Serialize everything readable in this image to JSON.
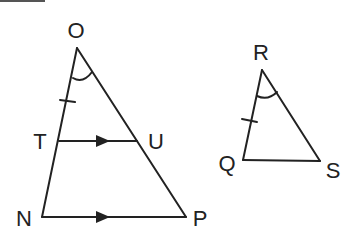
{
  "diagram": {
    "left_triangle": {
      "name": "Triangle ONP",
      "vertices": {
        "O": {
          "label": "O",
          "x": 77,
          "y": 48,
          "lx": 76,
          "ly": 38
        },
        "N": {
          "label": "N",
          "x": 42,
          "y": 217,
          "lx": 24,
          "ly": 226
        },
        "P": {
          "label": "P",
          "x": 186,
          "y": 217,
          "lx": 200,
          "ly": 226
        },
        "T": {
          "label": "T",
          "x": 59,
          "y": 141,
          "lx": 40,
          "ly": 149
        },
        "U": {
          "label": "U",
          "x": 137,
          "y": 141,
          "lx": 156,
          "ly": 149
        }
      },
      "segments": [
        "O-N",
        "O-P",
        "T-U",
        "N-P"
      ],
      "markings": {
        "angle_arc_at": "O",
        "tick_mark_on": "O-T",
        "parallel_arrows_on": [
          "T-U",
          "N-P"
        ]
      }
    },
    "right_triangle": {
      "name": "Triangle RQS",
      "vertices": {
        "R": {
          "label": "R",
          "x": 262,
          "y": 70,
          "lx": 261,
          "ly": 60
        },
        "Q": {
          "label": "Q",
          "x": 243,
          "y": 160,
          "lx": 227,
          "ly": 171
        },
        "S": {
          "label": "S",
          "x": 320,
          "y": 161,
          "lx": 333,
          "ly": 178
        }
      },
      "segments": [
        "R-Q",
        "R-S",
        "Q-S"
      ],
      "markings": {
        "angle_arc_at": "R",
        "tick_mark_on": "R-Q"
      }
    },
    "colors": {
      "stroke": "#222222",
      "background": "#ffffff"
    }
  }
}
